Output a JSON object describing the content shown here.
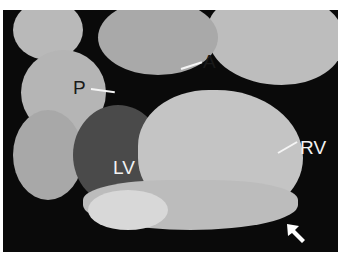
{
  "image": {
    "description": "Grayscale anatomical photograph of a dissected heart specimen on a black background",
    "labels": [
      {
        "id": "P",
        "text": "P"
      },
      {
        "id": "A",
        "text": "A"
      },
      {
        "id": "RV",
        "text": "RV"
      },
      {
        "id": "LV",
        "text": "LV"
      }
    ],
    "arrow": {
      "direction": "pointing up-left",
      "color": "#ffffff"
    },
    "colors": {
      "background": "#0a0a0a",
      "tissue": "#c8c8c8",
      "border": "#ffffff"
    }
  }
}
